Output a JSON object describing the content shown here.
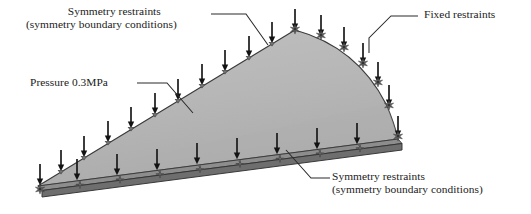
{
  "figure": {
    "type": "fea-boundary-condition-diagram",
    "colors": {
      "body_fill": "#b5b5b5",
      "body_fill_light": "#c4c4c4",
      "edge_stroke": "#3a3a3a",
      "slab_top": "#8d8d8d",
      "slab_front": "#6e6e6e",
      "arrow": "#1c1c1c",
      "restraint": "#555555",
      "leader": "#2a2a2a",
      "text": "#1a1a1a",
      "background": "#ffffff"
    },
    "geometry": {
      "apex": [
        295,
        30
      ],
      "left_vertex": [
        38,
        186
      ],
      "right_vertex": [
        398,
        139
      ],
      "right_edge": "convex-curved",
      "upper_left_edge": "straight",
      "bottom_edge": "extruded-slab"
    }
  },
  "labels": {
    "symmetry_top": {
      "line1": "Symmetry restraints",
      "line2": "(symmetry boundary conditions)"
    },
    "pressure": {
      "text": "Pressure 0.3MPa",
      "value": "0.3",
      "unit": "MPa"
    },
    "fixed": {
      "text": "Fixed restraints"
    },
    "symmetry_bottom": {
      "line1": "Symmetry restraints",
      "line2": "(symmetry boundary conditions)"
    }
  },
  "load_arrows": {
    "upper_left_edge_count": 11,
    "right_edge_count": 6,
    "bottom_edge_count": 10,
    "direction": "downward"
  },
  "restraint_markers": {
    "upper_left_edge": "cone-symmetry-marker",
    "right_edge": "star-fixed-marker",
    "bottom_edge": "cross-symmetry-marker",
    "corners": "star-fixed-marker"
  }
}
